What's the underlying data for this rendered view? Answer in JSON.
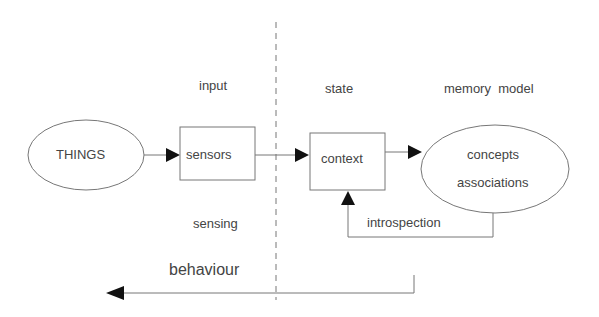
{
  "labels": {
    "input": "input",
    "state": "state",
    "memory_model": "memory  model",
    "sensing": "sensing",
    "behaviour": "behaviour",
    "introspection": "introspection"
  },
  "nodes": {
    "things": "THINGS",
    "sensors": "sensors",
    "context": "context",
    "concepts": "concepts",
    "associations": "associations"
  },
  "edges": [
    {
      "from": "THINGS",
      "to": "sensors"
    },
    {
      "from": "sensors",
      "to": "context"
    },
    {
      "from": "context",
      "to": "concepts/associations"
    },
    {
      "from": "concepts/associations",
      "to": "context",
      "label": "introspection"
    },
    {
      "from": "concepts/associations",
      "to": "left",
      "label": "behaviour"
    }
  ]
}
